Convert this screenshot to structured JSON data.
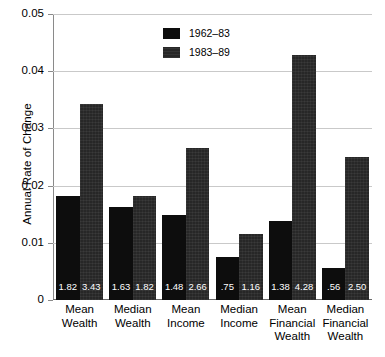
{
  "chart_data": {
    "type": "bar",
    "title": "",
    "xlabel": "",
    "ylabel": "Annual Rate of Change",
    "ylim": [
      0,
      0.05
    ],
    "yticks": [
      0,
      0.01,
      0.02,
      0.03,
      0.04,
      0.05
    ],
    "ytick_labels": [
      "0",
      "0.01",
      "0.02",
      "0.03",
      "0.04",
      "0.05"
    ],
    "grid": true,
    "legend_position": "top-center",
    "categories": [
      "Mean\nWealth",
      "Median\nWealth",
      "Mean\nIncome",
      "Median\nIncome",
      "Mean\nFinancial\nWealth",
      "Median\nFinancial\nWealth"
    ],
    "series": [
      {
        "name": "1962–83",
        "color": "#0d0d0d",
        "values": [
          0.0182,
          0.0163,
          0.0148,
          0.0075,
          0.0138,
          0.0056
        ],
        "labels": [
          "1.82",
          "1.63",
          "1.48",
          ".75",
          "1.38",
          ".56"
        ]
      },
      {
        "name": "1983–89",
        "color": "#272727",
        "values": [
          0.0343,
          0.0182,
          0.0266,
          0.0116,
          0.0428,
          0.025
        ],
        "labels": [
          "3.43",
          "1.82",
          "2.66",
          "1.16",
          "4.28",
          "2.50"
        ]
      }
    ]
  },
  "legend": {
    "items": [
      {
        "label": "1962–83"
      },
      {
        "label": "1983–89"
      }
    ]
  },
  "axes": {
    "y_title": "Annual Rate of Change"
  }
}
